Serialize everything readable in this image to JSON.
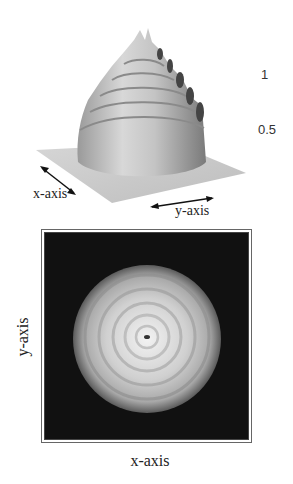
{
  "figure": {
    "top_panel": {
      "type": "3d-surface",
      "description": "Surface plot of concentric ring structure (stepped cone with spiked ridges)",
      "z_ticks": [
        "1",
        "0.5"
      ],
      "x_label": "x-axis",
      "y_label": "y-axis"
    },
    "bottom_panel": {
      "type": "intensity-image",
      "description": "Grayscale top view showing concentric bright rings on dark background",
      "x_label": "x-axis",
      "y_label": "y-axis"
    },
    "colors": {
      "background": "#ffffff",
      "base_plane": "#c8c8c8",
      "image_background": "#111111",
      "text": "#222222"
    }
  }
}
